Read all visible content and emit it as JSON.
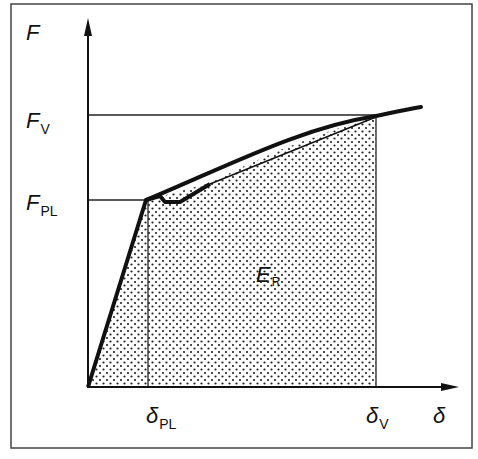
{
  "diagram": {
    "type": "force-displacement curve",
    "axes": {
      "y": {
        "symbol": "F"
      },
      "x": {
        "symbol": "δ"
      }
    },
    "labels": {
      "F": "F",
      "Fv_main": "F",
      "Fv_sub": "V",
      "Fpl_main": "F",
      "Fpl_sub": "PL",
      "dpl_main": "δ",
      "dpl_sub": "PL",
      "dv_main": "δ",
      "dv_sub": "V",
      "delta": "δ",
      "area_main": "E",
      "area_sub": "R"
    }
  }
}
